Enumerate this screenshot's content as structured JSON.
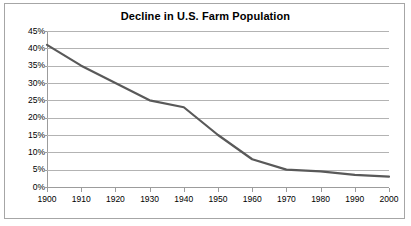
{
  "chart_data": {
    "type": "line",
    "title": "Decline in U.S. Farm Population",
    "xlabel": "",
    "ylabel": "",
    "categories": [
      "1900",
      "1910",
      "1920",
      "1930",
      "1940",
      "1950",
      "1960",
      "1970",
      "1980",
      "1990",
      "2000"
    ],
    "x": [
      1900,
      1910,
      1920,
      1930,
      1940,
      1950,
      1960,
      1970,
      1980,
      1990,
      2000
    ],
    "values": [
      41,
      35,
      30,
      25,
      23,
      15,
      8,
      5,
      4.5,
      3.5,
      3
    ],
    "series": [
      {
        "name": "U.S. Farm Population",
        "values": [
          41,
          35,
          30,
          25,
          23,
          15,
          8,
          5,
          4.5,
          3.5,
          3
        ]
      }
    ],
    "y_tick_labels": [
      "45%",
      "40%",
      "35%",
      "30%",
      "25%",
      "20%",
      "15%",
      "10%",
      "5%",
      "0%"
    ],
    "y_ticks": [
      45,
      40,
      35,
      30,
      25,
      20,
      15,
      10,
      5,
      0
    ],
    "ylim": [
      0,
      45
    ],
    "xlim": [
      1900,
      2000
    ],
    "grid": true,
    "legend": false,
    "line_color": "#595959",
    "gridline_color": "#b3b3b3",
    "axis_color": "#9c9c9c",
    "border_color": "#a6a6a6",
    "value_suffix": "%"
  }
}
